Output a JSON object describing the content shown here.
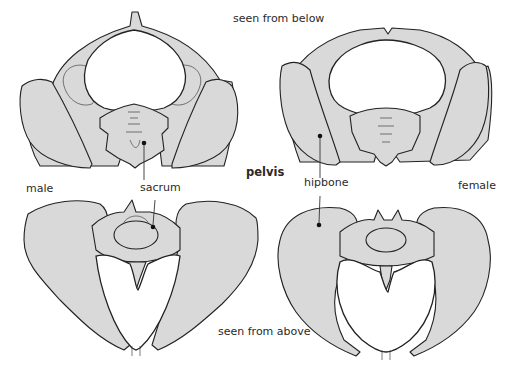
{
  "title": "pelvis",
  "view_labels": {
    "top": "seen from below",
    "bottom": "seen from above"
  },
  "sex_labels": {
    "left": "male",
    "right": "female"
  },
  "part_labels": {
    "sacrum": "sacrum",
    "hipbone": "hipbone"
  },
  "colors": {
    "bone_fill": "#d9d9d9",
    "bone_stroke": "#222222",
    "background": "#ffffff",
    "text": "#2a2a2a"
  },
  "figures": [
    {
      "id": "male-below",
      "sex": "male",
      "view": "seen from below"
    },
    {
      "id": "female-below",
      "sex": "female",
      "view": "seen from below"
    },
    {
      "id": "male-above",
      "sex": "male",
      "view": "seen from above"
    },
    {
      "id": "female-above",
      "sex": "female",
      "view": "seen from above"
    }
  ]
}
